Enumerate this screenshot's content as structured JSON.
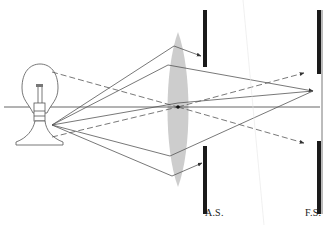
{
  "diagram": {
    "labels": {
      "aperture_stop": "A.S.",
      "field_stop": "F.S."
    },
    "elements": {
      "light_source": "light-bulb",
      "lens": "biconvex-lens",
      "stops": [
        "aperture-stop",
        "field-stop"
      ]
    },
    "colors": {
      "line": "#555555",
      "stop": "#1a1a1a",
      "lens_fill": "#cfcfcf",
      "background": "#ffffff"
    }
  }
}
